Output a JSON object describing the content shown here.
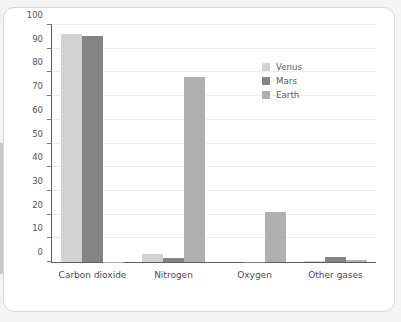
{
  "chart_data": {
    "type": "bar",
    "title": "",
    "subtitle": "",
    "xlabel": "",
    "ylabel": "",
    "ylim": [
      0,
      100
    ],
    "yticks": [
      0,
      10,
      20,
      30,
      40,
      50,
      60,
      70,
      80,
      90,
      100
    ],
    "ytick_labels": [
      "0",
      "10",
      "20",
      "30",
      "40",
      "50",
      "60",
      "70",
      "80",
      "90",
      "100"
    ],
    "grid": true,
    "legend_position": "upper-right-inside",
    "categories": [
      "Carbon dioxide",
      "Nitrogen",
      "Oxygen",
      "Other gases"
    ],
    "series": [
      {
        "name": "Venus",
        "color": "#d2d2d2",
        "values": [
          96.0,
          3.5,
          0.0,
          0.5
        ]
      },
      {
        "name": "Mars",
        "color": "#848484",
        "values": [
          95.5,
          1.9,
          0.13,
          2.0
        ]
      },
      {
        "name": "Earth",
        "color": "#b0b0b0",
        "values": [
          0.04,
          78.0,
          21.0,
          0.97
        ]
      }
    ]
  },
  "legend": {
    "entries": [
      {
        "label": "Venus",
        "swatch": "legend-swatch-venus",
        "color": "#d2d2d2"
      },
      {
        "label": "Mars",
        "swatch": "legend-swatch-mars",
        "color": "#848484"
      },
      {
        "label": "Earth",
        "swatch": "legend-swatch-earth",
        "color": "#b0b0b0"
      }
    ]
  },
  "colors": {
    "page_background": "#f4f4f4",
    "card_background": "#ffffff",
    "card_border": "#d8d8d8",
    "axis": "#5d5d5d",
    "gridline": "#ececec",
    "tick_text": "#555555",
    "category_text": "#4a4a4a",
    "left_tab": "#c9c9c9"
  }
}
